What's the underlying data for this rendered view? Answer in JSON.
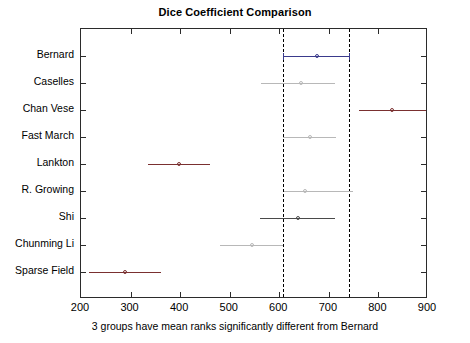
{
  "chart_data": {
    "type": "line",
    "subtype": "multiple-comparison-interval-plot",
    "title": "Dice Coefficient Comparison",
    "xlabel": "3 groups have mean ranks significantly different from Bernard",
    "ylabel": "",
    "xlim": [
      200,
      900
    ],
    "xticks": [
      200,
      300,
      400,
      500,
      600,
      700,
      800,
      900
    ],
    "xticklabels": [
      "200",
      "300",
      "400",
      "500",
      "600",
      "700",
      "800",
      "900"
    ],
    "grid": false,
    "legend": null,
    "reference_group": "Bernard",
    "reference_lines": [
      607,
      740
    ],
    "reference_line_style": "dashed",
    "reference_line_color": "#000000",
    "categories": [
      "Bernard",
      "Caselles",
      "Chan Vese",
      "Fast March",
      "Lankton",
      "R. Growing",
      "Shi",
      "Chunming Li",
      "Sparse Field"
    ],
    "points": [
      {
        "group": "Bernard",
        "mean_rank": 677,
        "lower": 607,
        "upper": 740,
        "significant": false,
        "color": "#3a3a8c",
        "has_caps": true
      },
      {
        "group": "Caselles",
        "mean_rank": 644,
        "lower": 563,
        "upper": 712,
        "significant": false,
        "color": "#b8b8b8",
        "has_caps": false
      },
      {
        "group": "Chan Vese",
        "mean_rank": 828,
        "lower": 760,
        "upper": 895,
        "significant": true,
        "color": "#7a3030",
        "has_caps": false
      },
      {
        "group": "Fast March",
        "mean_rank": 661,
        "lower": 608,
        "upper": 714,
        "significant": false,
        "color": "#b8b8b8",
        "has_caps": false
      },
      {
        "group": "Lankton",
        "mean_rank": 397,
        "lower": 336,
        "upper": 461,
        "significant": true,
        "color": "#7a3030",
        "has_caps": false
      },
      {
        "group": "R. Growing",
        "mean_rank": 651,
        "lower": 609,
        "upper": 749,
        "significant": false,
        "color": "#b8b8b8",
        "has_caps": false
      },
      {
        "group": "Shi",
        "mean_rank": 637,
        "lower": 562,
        "upper": 712,
        "significant": false,
        "color": "#4a4a4a",
        "has_caps": false
      },
      {
        "group": "Chunming Li",
        "mean_rank": 545,
        "lower": 481,
        "upper": 607,
        "significant": false,
        "color": "#b8b8b8",
        "has_caps": false
      },
      {
        "group": "Sparse Field",
        "mean_rank": 289,
        "lower": 216,
        "upper": 361,
        "significant": true,
        "color": "#7a3030",
        "has_caps": false
      }
    ]
  },
  "figure": {
    "title": "Dice Coefficient Comparison",
    "caption": "3 groups have mean ranks significantly different from Bernard"
  }
}
